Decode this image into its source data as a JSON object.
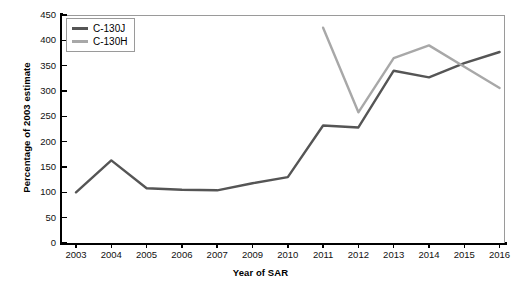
{
  "chart": {
    "type": "line",
    "y_axis_title": "Percentage of 2003 estimate",
    "x_axis_title": "Year of SAR"
  },
  "legend": {
    "position": "top-left",
    "entries": [
      {
        "label": "C-130J",
        "color": "#555555",
        "icon": "line-swatch-icon"
      },
      {
        "label": "C-130H",
        "color": "#a8a8a8",
        "icon": "line-swatch-icon"
      }
    ]
  },
  "axes": {
    "y_ticks": [
      "0",
      "50",
      "100",
      "150",
      "200",
      "250",
      "300",
      "350",
      "400",
      "450"
    ],
    "x_ticks": [
      "2003",
      "2004",
      "2005",
      "2006",
      "2007",
      "2009",
      "2010",
      "2011",
      "2012",
      "2013",
      "2014",
      "2015",
      "2016"
    ]
  },
  "chart_data": {
    "type": "line",
    "title": "",
    "xlabel": "Year of SAR",
    "ylabel": "Percentage of 2003 estimate",
    "categories": [
      "2003",
      "2004",
      "2005",
      "2006",
      "2007",
      "2009",
      "2010",
      "2011",
      "2012",
      "2013",
      "2014",
      "2015",
      "2016"
    ],
    "ylim": [
      0,
      450
    ],
    "ytick_step": 50,
    "grid": false,
    "legend_position": "top-left",
    "note": "Year 2008 is absent from the category axis",
    "series": [
      {
        "name": "C-130J",
        "color": "#555555",
        "values": [
          100,
          163,
          108,
          105,
          104,
          118,
          130,
          232,
          228,
          340,
          327,
          355,
          377
        ]
      },
      {
        "name": "C-130H",
        "color": "#a8a8a8",
        "values": [
          null,
          null,
          null,
          null,
          null,
          null,
          null,
          425,
          258,
          365,
          390,
          348,
          306
        ]
      }
    ]
  }
}
